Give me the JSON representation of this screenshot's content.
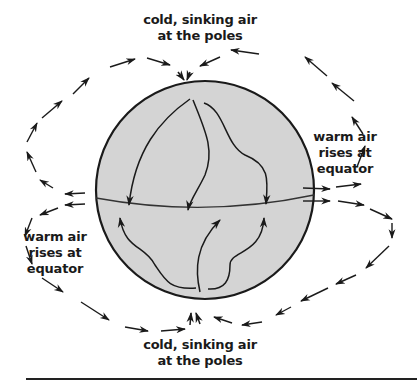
{
  "diagram": {
    "type": "atmospheric-circulation",
    "labels": {
      "top": [
        "cold, sinking air",
        "at the poles"
      ],
      "bottom": [
        "cold, sinking air",
        "at the poles"
      ],
      "right": [
        "warm air",
        "rises at",
        "equator"
      ],
      "left": [
        "warm air",
        "rises at",
        "equator"
      ]
    },
    "colors": {
      "globe_fill": "#d4d4d4",
      "stroke": "#1a1a1a",
      "background": "#ffffff"
    },
    "elements": {
      "globe": "sphere with equator line",
      "inner_arrows_north": 3,
      "inner_arrows_south": 3,
      "outer_loops": [
        "top loop: equator rises up and sinks at north pole",
        "bottom loop: equator rises and sinks at south pole"
      ]
    }
  }
}
